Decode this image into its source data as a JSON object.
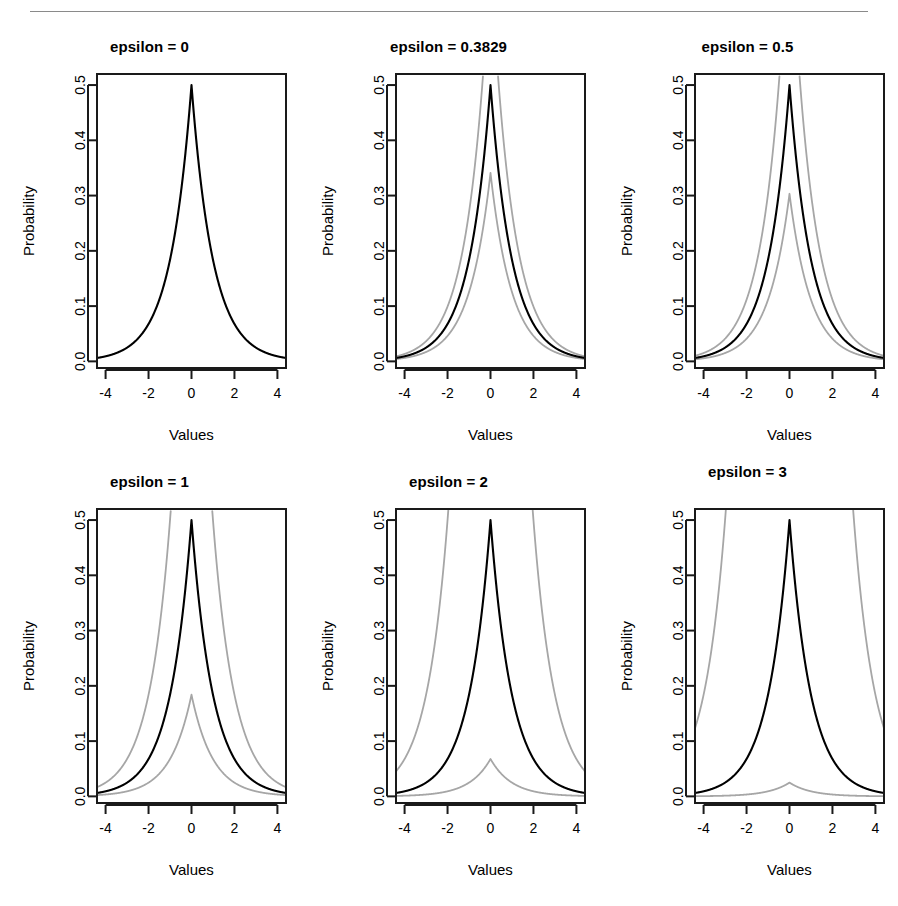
{
  "page": {
    "running_head": "",
    "rule_color": "#8a8a8a"
  },
  "figure": {
    "x_axis_label": "Values",
    "y_axis_label": "Probability",
    "x_ticks": [
      "-4",
      "-2",
      "0",
      "2",
      "4"
    ],
    "x_tick_values": [
      -4,
      -2,
      0,
      2,
      4
    ],
    "y_ticks": [
      "0.0",
      "0.1",
      "0.2",
      "0.3",
      "0.4",
      "0.5"
    ],
    "y_tick_values": [
      0.0,
      0.1,
      0.2,
      0.3,
      0.4,
      0.5
    ],
    "center_color": "#000000",
    "bound_color": "#a6a6a6",
    "box_color": "#1a1a1a"
  },
  "chart_data": {
    "type": "line",
    "title": "",
    "xlabel": "Values",
    "ylabel": "Probability",
    "xlim": [
      -4.4,
      4.4
    ],
    "ylim": [
      -0.012,
      0.52
    ],
    "xticks": [
      -4,
      -2,
      0,
      2,
      4
    ],
    "yticks": [
      0.0,
      0.1,
      0.2,
      0.3,
      0.4,
      0.5
    ],
    "grid": false,
    "legend": "none",
    "panel_layout": [
      2,
      3
    ],
    "formula": {
      "center": "0.5*exp(-abs(x))",
      "upper": "0.5*exp(-abs(x))*exp(epsilon)",
      "lower": "0.5*exp(-abs(x))*exp(-epsilon)"
    },
    "panels": [
      {
        "title": "epsilon = 0",
        "epsilon": 0,
        "title_high": false,
        "series": [
          {
            "name": "center",
            "color": "#000000",
            "peak": 0.5,
            "edge_value": 0.0092,
            "x": [
              -4,
              -3.5,
              -3,
              -2.5,
              -2,
              -1.5,
              -1,
              -0.75,
              -0.5,
              -0.25,
              0,
              0.25,
              0.5,
              0.75,
              1,
              1.5,
              2,
              2.5,
              3,
              3.5,
              4
            ],
            "y": [
              0.0092,
              0.0151,
              0.0249,
              0.041,
              0.0677,
              0.1116,
              0.1839,
              0.2362,
              0.3033,
              0.3894,
              0.5,
              0.3894,
              0.3033,
              0.2362,
              0.1839,
              0.1116,
              0.0677,
              0.041,
              0.0249,
              0.0151,
              0.0092
            ]
          }
        ]
      },
      {
        "title": "epsilon = 0.3829",
        "epsilon": 0.3829,
        "title_high": false,
        "series": [
          {
            "name": "upper",
            "color": "#a6a6a6",
            "peak": 0.7335,
            "edge_value": 0.0135,
            "clipped_at_x": 0.3829
          },
          {
            "name": "center",
            "color": "#000000",
            "peak": 0.5,
            "edge_value": 0.0092
          },
          {
            "name": "lower",
            "color": "#a6a6a6",
            "peak": 0.3409,
            "edge_value": 0.0063
          }
        ]
      },
      {
        "title": "epsilon = 0.5",
        "epsilon": 0.5,
        "title_high": false,
        "series": [
          {
            "name": "upper",
            "color": "#a6a6a6",
            "peak": 0.8244,
            "edge_value": 0.0152,
            "clipped_at_x": 0.5
          },
          {
            "name": "center",
            "color": "#000000",
            "peak": 0.5,
            "edge_value": 0.0092
          },
          {
            "name": "lower",
            "color": "#a6a6a6",
            "peak": 0.3033,
            "edge_value": 0.0056
          }
        ]
      },
      {
        "title": "epsilon = 1",
        "epsilon": 1,
        "title_high": false,
        "series": [
          {
            "name": "upper",
            "color": "#a6a6a6",
            "peak": 1.3591,
            "edge_value": 0.025,
            "clipped_at_x": 1.0
          },
          {
            "name": "center",
            "color": "#000000",
            "peak": 0.5,
            "edge_value": 0.0092
          },
          {
            "name": "lower",
            "color": "#a6a6a6",
            "peak": 0.1839,
            "edge_value": 0.0034
          }
        ]
      },
      {
        "title": "epsilon = 2",
        "epsilon": 2,
        "title_high": false,
        "series": [
          {
            "name": "upper",
            "color": "#a6a6a6",
            "peak": 3.6945,
            "edge_value": 0.0677,
            "clipped_at_x": 2.0
          },
          {
            "name": "center",
            "color": "#000000",
            "peak": 0.5,
            "edge_value": 0.0092
          },
          {
            "name": "lower",
            "color": "#a6a6a6",
            "peak": 0.0677,
            "edge_value": 0.0012
          }
        ]
      },
      {
        "title": "epsilon = 3",
        "epsilon": 3,
        "title_high": true,
        "series": [
          {
            "name": "upper",
            "color": "#a6a6a6",
            "peak": 10.0428,
            "edge_value": 0.1839,
            "clipped_at_x": 3.0
          },
          {
            "name": "center",
            "color": "#000000",
            "peak": 0.5,
            "edge_value": 0.0092
          },
          {
            "name": "lower",
            "color": "#a6a6a6",
            "peak": 0.0249,
            "edge_value": 0.00046
          }
        ]
      }
    ]
  }
}
